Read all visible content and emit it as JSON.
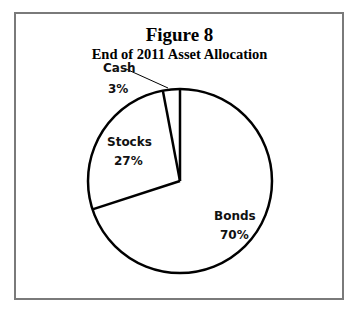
{
  "chart_data": {
    "type": "pie",
    "title": "Figure 8",
    "subtitle": "End of 2011 Asset Allocation",
    "categories": [
      "Bonds",
      "Stocks",
      "Cash"
    ],
    "values": [
      70,
      27,
      3
    ],
    "labels": [
      "Bonds 70%",
      "Stocks 27%",
      "Cash 3%"
    ],
    "start_angle_deg": 0,
    "direction": "clockwise-from-top",
    "fill": "#ffffff",
    "stroke": "#000000",
    "legend": "none"
  },
  "figure": {
    "title": "Figure 8",
    "subtitle": "End of 2011 Asset Allocation",
    "slices": [
      {
        "name": "Bonds",
        "pct": "70%"
      },
      {
        "name": "Stocks",
        "pct": "27%"
      },
      {
        "name": "Cash",
        "pct": "3%"
      }
    ]
  }
}
